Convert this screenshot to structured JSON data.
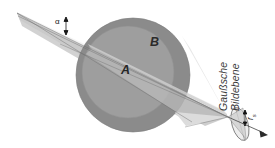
{
  "figure": {
    "domain": "optics-schematic",
    "background_color": "#ffffff",
    "labels": {
      "inner_region": "A",
      "outer_region": "B",
      "angle": "α",
      "image_plane_line1": "Gaußsche",
      "image_plane_line2": "Bildebene",
      "radius_symbol": "r",
      "radius_subscript": "s"
    },
    "colors": {
      "outer_circle": "#8c8c8c",
      "inner_circle": "#9d9d9d",
      "ray_bundle_light": "#d8d8d8",
      "ray_bundle_mid": "#c4c4c4",
      "ray_bundle_pale": "#e8e8e8",
      "ray_line": "#6f6f6f",
      "outline": "#555555",
      "text": "#1b1b1b",
      "text_plane": "#3a3a3a"
    },
    "geometry": {
      "source_apex": [
        17,
        13
      ],
      "focus_point": [
        228,
        117
      ],
      "outer_circle_center": [
        133,
        75
      ],
      "outer_circle_radius": 57,
      "inner_circle_center": [
        128,
        72
      ],
      "inner_circle_radius": 46,
      "axis_arrow_tip": [
        268,
        135
      ],
      "image_plane_ellipse_center": [
        240,
        124
      ],
      "image_plane_ellipse_rx": 8,
      "image_plane_ellipse_ry": 17,
      "image_plane_ellipse_rotation": -16
    },
    "elements": [
      "ray-cone-upper",
      "ray-cone-lower",
      "ray-cone-marginal",
      "angle-marker-alpha",
      "outer-sphere-region-b",
      "inner-sphere-region-a",
      "gaussian-image-plane-ellipse",
      "radius-marker-rs",
      "optical-axis-arrow"
    ]
  }
}
